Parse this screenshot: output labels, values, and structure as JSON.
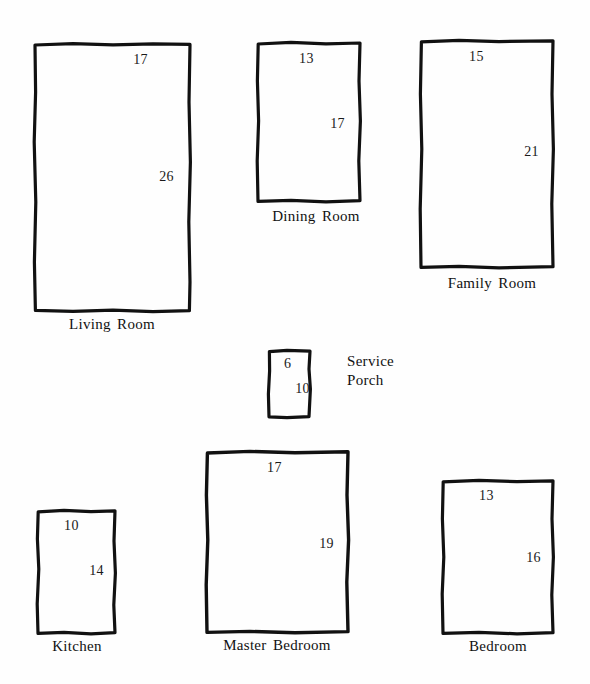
{
  "diagram": {
    "style": "hand-drawn rectangles with dimension annotations",
    "units_note": "",
    "stroke_color": "#111111",
    "background_color": "#ffffff"
  },
  "rooms": [
    {
      "id": "living-room",
      "name_line1": "Living",
      "name_line2": "Room",
      "name": "Living Room",
      "width_label": "17",
      "height_label": "26",
      "x": 33,
      "y": 42,
      "w": 159,
      "h": 271,
      "label_y": 316
    },
    {
      "id": "dining-room",
      "name_line1": "Dining",
      "name_line2": "Room",
      "name": "Dining Room",
      "width_label": "13",
      "height_label": "17",
      "x": 256,
      "y": 41,
      "w": 106,
      "h": 162,
      "label_y": 208
    },
    {
      "id": "family-room",
      "name_line1": "Family",
      "name_line2": "Room",
      "name": "Family Room",
      "width_label": "15",
      "height_label": "21",
      "x": 419,
      "y": 39,
      "w": 136,
      "h": 230,
      "label_y": 275
    },
    {
      "id": "service-porch",
      "name_line1": "Service",
      "name_line2": "Porch",
      "name": "Service Porch",
      "width_label": "6",
      "height_label": "10",
      "x": 267,
      "y": 349,
      "w": 45,
      "h": 70,
      "label_y": 0
    },
    {
      "id": "kitchen",
      "name_line1": "Kitchen",
      "name_line2": "",
      "name": "Kitchen",
      "width_label": "10",
      "height_label": "14",
      "x": 36,
      "y": 509,
      "w": 81,
      "h": 126,
      "label_y": 638
    },
    {
      "id": "master-bedroom",
      "name_line1": "Master",
      "name_line2": "Bedroom",
      "name": "Master Bedroom",
      "width_label": "17",
      "height_label": "19",
      "x": 205,
      "y": 450,
      "w": 145,
      "h": 184,
      "label_y": 637
    },
    {
      "id": "bedroom",
      "name_line1": "Bedroom",
      "name_line2": "",
      "name": "Bedroom",
      "width_label": "13",
      "height_label": "16",
      "x": 441,
      "y": 479,
      "w": 114,
      "h": 156,
      "label_y": 638
    }
  ],
  "side_labels": [
    {
      "id": "service-porch-label",
      "line1": "Service",
      "line2": "Porch",
      "x": 347,
      "y": 352
    }
  ]
}
